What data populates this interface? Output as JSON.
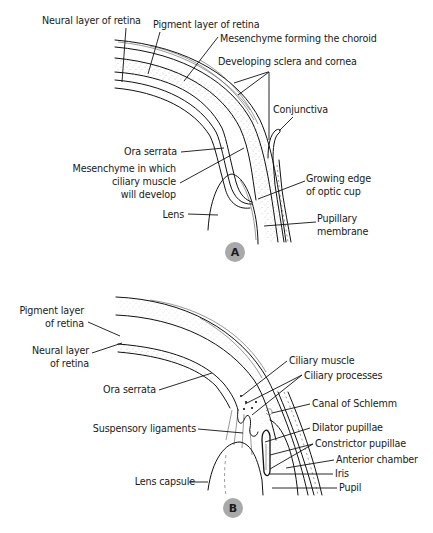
{
  "panels": [
    {
      "id": "A",
      "badge": {
        "label": "A",
        "cx": 235,
        "cy": 252,
        "r": 10,
        "color": "#a9a9a9"
      },
      "labels": [
        {
          "name": "neural-layer-of-retina",
          "lines": [
            "Neural layer of retina"
          ],
          "x": 42,
          "y": 24,
          "anchor": "start"
        },
        {
          "name": "pigment-layer-of-retina",
          "lines": [
            "Pigment layer of retina"
          ],
          "x": 153,
          "y": 28,
          "anchor": "start"
        },
        {
          "name": "mesenchyme-forming-choroid",
          "lines": [
            "Mesenchyme forming the choroid"
          ],
          "x": 220,
          "y": 42,
          "anchor": "start"
        },
        {
          "name": "developing-sclera-and-cornea",
          "lines": [
            "Developing sclera and cornea"
          ],
          "x": 218,
          "y": 65,
          "anchor": "start"
        },
        {
          "name": "conjunctiva",
          "lines": [
            "Conjunctiva"
          ],
          "x": 273,
          "y": 113,
          "anchor": "start"
        },
        {
          "name": "ora-serrata-a",
          "lines": [
            "Ora serrata"
          ],
          "x": 177,
          "y": 155,
          "anchor": "end"
        },
        {
          "name": "mesenchyme-ciliary-muscle",
          "lines": [
            "Mesenchyme in which",
            "ciliary muscle",
            "will develop"
          ],
          "x": 176,
          "y": 172,
          "anchor": "end"
        },
        {
          "name": "growing-edge-optic-cup",
          "lines": [
            "Growing edge",
            "of optic cup"
          ],
          "x": 306,
          "y": 182,
          "anchor": "start"
        },
        {
          "name": "lens",
          "lines": [
            "Lens"
          ],
          "x": 184,
          "y": 218,
          "anchor": "end"
        },
        {
          "name": "pupillary-membrane",
          "lines": [
            "Pupillary",
            "membrane"
          ],
          "x": 317,
          "y": 222,
          "anchor": "start"
        }
      ]
    },
    {
      "id": "B",
      "badge": {
        "label": "B",
        "cx": 233,
        "cy": 508,
        "r": 10,
        "color": "#a9a9a9"
      },
      "labels": [
        {
          "name": "pigment-layer-of-retina-b",
          "lines": [
            "Pigment layer",
            "of retina"
          ],
          "x": 84,
          "y": 314,
          "anchor": "end"
        },
        {
          "name": "neural-layer-of-retina-b",
          "lines": [
            "Neural layer",
            "of retina"
          ],
          "x": 89,
          "y": 354,
          "anchor": "end"
        },
        {
          "name": "ora-serrata-b",
          "lines": [
            "Ora serrata"
          ],
          "x": 156,
          "y": 393,
          "anchor": "end"
        },
        {
          "name": "ciliary-muscle",
          "lines": [
            "Ciliary muscle"
          ],
          "x": 289,
          "y": 364,
          "anchor": "start"
        },
        {
          "name": "ciliary-processes",
          "lines": [
            "Ciliary processes"
          ],
          "x": 304,
          "y": 379,
          "anchor": "start"
        },
        {
          "name": "canal-of-schlemm",
          "lines": [
            "Canal of Schlemm"
          ],
          "x": 312,
          "y": 407,
          "anchor": "start"
        },
        {
          "name": "suspensory-ligaments",
          "lines": [
            "Suspensory ligaments"
          ],
          "x": 196,
          "y": 432,
          "anchor": "end"
        },
        {
          "name": "dilator-pupillae",
          "lines": [
            "Dilator pupillae"
          ],
          "x": 312,
          "y": 431,
          "anchor": "start"
        },
        {
          "name": "constrictor-pupillae",
          "lines": [
            "Constrictor pupillae"
          ],
          "x": 315,
          "y": 447,
          "anchor": "start"
        },
        {
          "name": "anterior-chamber",
          "lines": [
            "Anterior chamber"
          ],
          "x": 336,
          "y": 463,
          "anchor": "start"
        },
        {
          "name": "iris",
          "lines": [
            "Iris"
          ],
          "x": 335,
          "y": 477,
          "anchor": "start"
        },
        {
          "name": "lens-capsule",
          "lines": [
            "Lens capsule"
          ],
          "x": 195,
          "y": 485,
          "anchor": "end"
        },
        {
          "name": "pupil",
          "lines": [
            "Pupil"
          ],
          "x": 339,
          "y": 491,
          "anchor": "start"
        }
      ]
    }
  ],
  "leaders": [
    {
      "for": "neural-layer-of-retina",
      "points": [
        [
          126,
          28
        ],
        [
          122,
          82
        ]
      ]
    },
    {
      "for": "pigment-layer-of-retina",
      "points": [
        [
          160,
          32
        ],
        [
          148,
          74
        ]
      ]
    },
    {
      "for": "mesenchyme-forming-choroid",
      "points": [
        [
          218,
          37
        ],
        [
          184,
          81
        ]
      ]
    },
    {
      "for": "developing-sclera-and-cornea",
      "points": [
        [
          234,
          83
        ],
        [
          268,
          72
        ],
        [
          269,
          72
        ],
        [
          238,
          95
        ]
      ]
    },
    {
      "for": "developing-sclera-and-cornea",
      "points": [
        [
          269,
          72
        ],
        [
          269,
          140
        ]
      ]
    },
    {
      "for": "conjunctiva",
      "points": [
        [
          293,
          117
        ],
        [
          279,
          131
        ]
      ]
    },
    {
      "for": "ora-serrata-a",
      "points": [
        [
          181,
          152
        ],
        [
          224,
          148
        ]
      ]
    },
    {
      "for": "mesenchyme-ciliary-muscle",
      "points": [
        [
          180,
          183
        ],
        [
          244,
          148
        ]
      ]
    },
    {
      "for": "growing-edge-optic-cup",
      "points": [
        [
          305,
          181
        ],
        [
          258,
          199
        ]
      ]
    },
    {
      "for": "lens",
      "points": [
        [
          188,
          214
        ],
        [
          218,
          215
        ]
      ]
    },
    {
      "for": "pupillary-membrane",
      "points": [
        [
          316,
          222
        ],
        [
          264,
          226
        ]
      ]
    },
    {
      "for": "pigment-layer-of-retina-b",
      "points": [
        [
          88,
          322
        ],
        [
          120,
          336
        ]
      ]
    },
    {
      "for": "neural-layer-of-retina-b",
      "points": [
        [
          92,
          353
        ],
        [
          122,
          343
        ]
      ]
    },
    {
      "for": "ora-serrata-b",
      "points": [
        [
          159,
          390
        ],
        [
          212,
          373
        ]
      ]
    },
    {
      "for": "ciliary-muscle",
      "points": [
        [
          287,
          361
        ],
        [
          242,
          396
        ]
      ]
    },
    {
      "for": "ciliary-processes",
      "points": [
        [
          302,
          375
        ],
        [
          245,
          404
        ]
      ]
    },
    {
      "for": "ciliary-processes",
      "points": [
        [
          302,
          375
        ],
        [
          252,
          415
        ]
      ]
    },
    {
      "for": "canal-of-schlemm",
      "points": [
        [
          310,
          404
        ],
        [
          272,
          413
        ]
      ]
    },
    {
      "for": "suspensory-ligaments",
      "points": [
        [
          198,
          429
        ],
        [
          243,
          433
        ]
      ]
    },
    {
      "for": "dilator-pupillae",
      "points": [
        [
          310,
          428
        ],
        [
          265,
          442
        ]
      ]
    },
    {
      "for": "constrictor-pupillae",
      "points": [
        [
          313,
          444
        ],
        [
          270,
          455
        ]
      ]
    },
    {
      "for": "constrictor-pupillae",
      "points": [
        [
          313,
          444
        ],
        [
          270,
          469
        ]
      ]
    },
    {
      "for": "anterior-chamber",
      "points": [
        [
          334,
          460
        ],
        [
          286,
          468
        ]
      ]
    },
    {
      "for": "iris",
      "points": [
        [
          333,
          474
        ],
        [
          270,
          474
        ]
      ]
    },
    {
      "for": "lens-capsule",
      "points": [
        [
          189,
          482
        ],
        [
          208,
          482
        ]
      ]
    },
    {
      "for": "pupil",
      "points": [
        [
          337,
          488
        ],
        [
          272,
          488
        ]
      ]
    }
  ],
  "colors": {
    "line": "#111111",
    "text": "#1a1a1a",
    "badge": "#a9a9a9",
    "stipple": "#8a8a8a",
    "background": "#ffffff"
  }
}
